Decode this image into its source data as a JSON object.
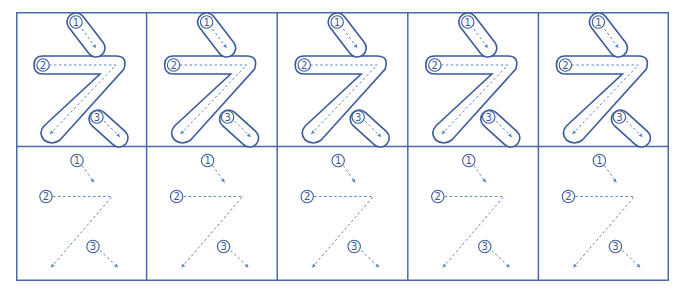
{
  "worksheet": {
    "character": "え",
    "romaji": "e",
    "columns": 5,
    "rows": [
      {
        "type": "outline-with-guides",
        "label": "trace-outline"
      },
      {
        "type": "guides-only",
        "label": "trace-guides"
      }
    ],
    "strokes": [
      {
        "number": "1",
        "glyph": "①"
      },
      {
        "number": "2",
        "glyph": "②"
      },
      {
        "number": "3",
        "glyph": "③"
      }
    ],
    "colors": {
      "grid": "#4a6aa6",
      "outline": "#3a5a9a",
      "guide": "#5b86c6",
      "badge": "#3a5a9a"
    }
  }
}
